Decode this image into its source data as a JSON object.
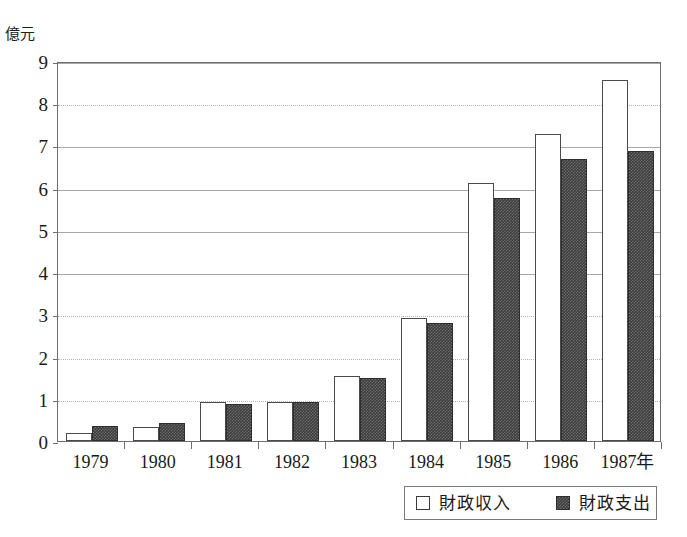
{
  "chart_data": {
    "type": "bar",
    "title": "",
    "xlabel": "年",
    "ylabel": "億元",
    "ylim": [
      0,
      9
    ],
    "ytick_labels": [
      "0",
      "1",
      "2",
      "3",
      "4",
      "5",
      "6",
      "7",
      "8",
      "9"
    ],
    "ytick_values": [
      0,
      1,
      2,
      3,
      4,
      5,
      6,
      7,
      8,
      9
    ],
    "grid": "horizontal",
    "gridline_styles": {
      "1": "dotted",
      "2": "dotted",
      "3": "dotted",
      "4": "solid",
      "5": "solid",
      "6": "solid",
      "7": "solid",
      "8": "dotted",
      "9": "solid"
    },
    "legend_position": "bottom-right",
    "categories": [
      "1979",
      "1980",
      "1981",
      "1982",
      "1983",
      "1984",
      "1985",
      "1986",
      "1987"
    ],
    "category_labels": [
      "1979",
      "1980",
      "1981",
      "1982",
      "1983",
      "1984",
      "1985",
      "1986",
      "1987年"
    ],
    "series": [
      {
        "name": "財政収入",
        "style": "hollow-white",
        "color": "#ffffff",
        "edge_color": "#4a4a4a",
        "values": [
          0.2,
          0.33,
          0.92,
          0.92,
          1.55,
          2.92,
          6.12,
          7.28,
          8.55
        ]
      },
      {
        "name": "財政支出",
        "style": "dark-dithered",
        "color": "#3c3c3c",
        "edge_color": "#2e2e2e",
        "values": [
          0.35,
          0.42,
          0.87,
          0.92,
          1.5,
          2.8,
          5.75,
          6.68,
          6.88
        ]
      }
    ]
  },
  "axis": {
    "unit_label": "億元",
    "frame_color": "#6e6e6e"
  },
  "legend": {
    "income_label": "財政収入",
    "expense_label": "財政支出"
  }
}
